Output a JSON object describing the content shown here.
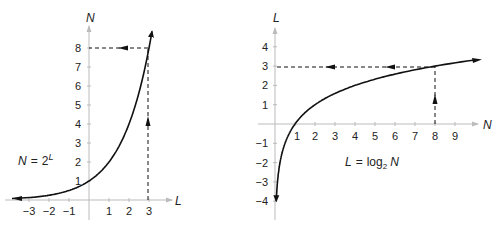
{
  "chart_data": [
    {
      "type": "line",
      "title": "",
      "equation": {
        "lhs": "N",
        "eq": "=",
        "base": "2",
        "exp": "L"
      },
      "xlabel": "L",
      "ylabel": "N",
      "xticks": [
        "−3",
        "−2",
        "−1",
        "1",
        "2",
        "3"
      ],
      "yticks": [
        "1",
        "2",
        "3",
        "4",
        "5",
        "6",
        "7",
        "8"
      ],
      "xlim": [
        -3.5,
        4.5
      ],
      "ylim": [
        0,
        9
      ],
      "series": [
        {
          "name": "N = 2^L",
          "x": [
            -3.3,
            -3,
            -2,
            -1,
            0,
            1,
            2,
            3,
            3.15
          ],
          "y": [
            0.1,
            0.125,
            0.25,
            0.5,
            1,
            2,
            4,
            8,
            8.9
          ]
        }
      ],
      "annotations": [
        {
          "type": "dashed-arrow",
          "from": [
            3,
            0
          ],
          "to": [
            3,
            8
          ],
          "direction": "up"
        },
        {
          "type": "dashed-arrow",
          "from": [
            3,
            8
          ],
          "to": [
            0,
            8
          ],
          "direction": "left"
        }
      ]
    },
    {
      "type": "line",
      "title": "",
      "equation": {
        "lhs": "L",
        "eq": "=",
        "fn": "log",
        "sub": "2",
        "arg": "N"
      },
      "xlabel": "N",
      "ylabel": "L",
      "xticks": [
        "1",
        "2",
        "3",
        "4",
        "5",
        "6",
        "7",
        "8",
        "9"
      ],
      "yticks": [
        "4",
        "3",
        "2",
        "1",
        "−1",
        "−2",
        "−3",
        "−4"
      ],
      "xlim": [
        0,
        10.5
      ],
      "ylim": [
        -4.5,
        5
      ],
      "series": [
        {
          "name": "L = log2 N",
          "x": [
            0.06,
            0.125,
            0.25,
            0.5,
            1,
            2,
            4,
            8,
            9.8
          ],
          "y": [
            -4,
            -3,
            -2,
            -1,
            0,
            1,
            2,
            3,
            3.3
          ]
        }
      ],
      "annotations": [
        {
          "type": "dashed-arrow",
          "from": [
            8,
            0
          ],
          "to": [
            8,
            3
          ],
          "direction": "up"
        },
        {
          "type": "dashed-arrow",
          "from": [
            8,
            3
          ],
          "to": [
            0,
            3
          ],
          "direction": "left"
        }
      ]
    }
  ]
}
